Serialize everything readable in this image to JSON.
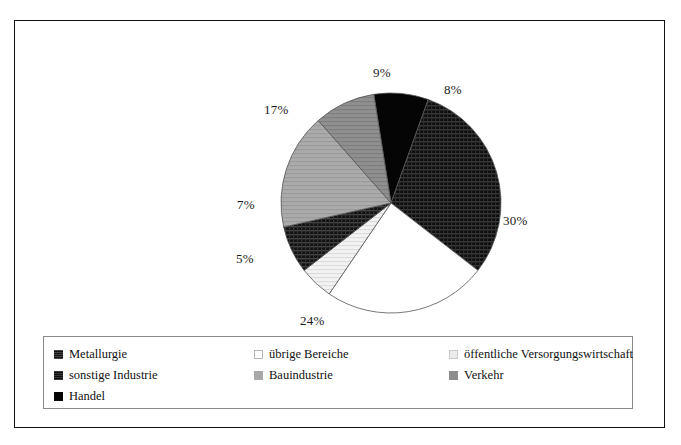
{
  "chart_data": {
    "type": "pie",
    "title": "",
    "subtitle": "",
    "xlabel": "",
    "ylabel": "",
    "grid": false,
    "legend_position": "bottom",
    "unit": "%",
    "categories": [
      "Handel",
      "sonstige Industrie",
      "übrige Bereiche",
      "öffentliche Versorgungswirtschaft",
      "Metallurgie",
      "Bauindustrie",
      "Verkehr"
    ],
    "values": [
      8,
      30,
      24,
      5,
      7,
      17,
      9
    ],
    "data_labels": [
      "8%",
      "30%",
      "24%",
      "5%",
      "7%",
      "17%",
      "9%"
    ],
    "slices": [
      {
        "label": "Handel",
        "value": 8,
        "display": "8%",
        "fill": "solid-black",
        "color": "#050505",
        "label_x": 429,
        "label_y": 61
      },
      {
        "label": "sonstige Industrie",
        "value": 30,
        "display": "30%",
        "fill": "dark-crosshatch",
        "color": "#171717",
        "label_x": 488,
        "label_y": 192
      },
      {
        "label": "übrige Bereiche",
        "value": 24,
        "display": "24%",
        "fill": "white",
        "color": "#ffffff",
        "label_x": 285,
        "label_y": 292
      },
      {
        "label": "öffentliche Versorgungswirtschaft",
        "value": 5,
        "display": "5%",
        "fill": "very-light-gray",
        "color": "#ececec",
        "label_x": 221,
        "label_y": 230
      },
      {
        "label": "Metallurgie",
        "value": 7,
        "display": "7%",
        "fill": "dark-texture",
        "color": "#1f1f1f",
        "label_x": 222,
        "label_y": 176
      },
      {
        "label": "Bauindustrie",
        "value": 17,
        "display": "17%",
        "fill": "medium-light-gray",
        "color": "#a8a8a8",
        "label_x": 249,
        "label_y": 81
      },
      {
        "label": "Verkehr",
        "value": 9,
        "display": "9%",
        "fill": "medium-gray",
        "color": "#8d8d8d",
        "label_x": 358,
        "label_y": 44
      }
    ]
  },
  "legend": {
    "rows": [
      [
        {
          "label": "Metallurgie",
          "swatch": "dark-texture",
          "color": "#1f1f1f"
        },
        {
          "label": "übrige Bereiche",
          "swatch": "white",
          "color": "#ffffff"
        },
        {
          "label": "öffentliche Versorgungswirtschaft",
          "swatch": "very-light-gray",
          "color": "#ececec"
        }
      ],
      [
        {
          "label": "sonstige Industrie",
          "swatch": "dark-crosshatch",
          "color": "#171717"
        },
        {
          "label": "Bauindustrie",
          "swatch": "medium-light-gray",
          "color": "#a8a8a8"
        },
        {
          "label": "Verkehr",
          "swatch": "medium-gray",
          "color": "#8d8d8d"
        }
      ],
      [
        {
          "label": "Handel",
          "swatch": "solid-black",
          "color": "#050505"
        }
      ]
    ]
  },
  "geometry": {
    "center_x": 376,
    "center_y": 182,
    "radius": 110,
    "start_angle_deg": -9
  }
}
